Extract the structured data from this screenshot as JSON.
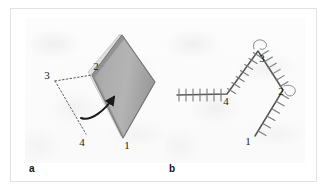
{
  "figure": {
    "width": 329,
    "height": 191,
    "background": "#ffffff",
    "frame_border_color": "#e2e2e2",
    "panel_background": "#fbfbfb"
  },
  "panels": [
    {
      "id": "a",
      "caption": "a",
      "description": "Shaded lozenge (diamond) plate with dotted construction lines and a curved arrow indicating folding direction",
      "vertex_labels": [
        {
          "label": "3",
          "x": 22,
          "y": 58
        },
        {
          "label": "2",
          "x": 72,
          "y": 57
        },
        {
          "label": "4",
          "x": 54,
          "y": 123
        },
        {
          "label": "1",
          "x": 104,
          "y": 127
        }
      ],
      "shape": {
        "name": "lozenge-plate",
        "fill_light": "#b9b9b9",
        "fill_dark": "#8e8e8e",
        "edge_color": "#6e6e6e",
        "rim_color": "#d9d9d9"
      },
      "arrow": {
        "name": "fold-arrow",
        "color": "#1a1a1a"
      },
      "dotted_line_color": "#4a4a4a"
    },
    {
      "id": "b",
      "caption": "b",
      "description": "Open polyline chain with hatch tick marks along each segment and numbered vertices",
      "vertex_labels": [
        {
          "label": "4",
          "x": 61,
          "y": 80
        },
        {
          "label": "3",
          "x": 96,
          "y": 37
        },
        {
          "label": "2",
          "x": 119,
          "y": 75
        },
        {
          "label": "1",
          "x": 88,
          "y": 123
        }
      ],
      "chain_color": "#565656",
      "hatch_color": "#7a7a7a",
      "curl_color": "#8a8a8a"
    }
  ],
  "colors": {
    "ink": "#191919",
    "caption": "#141414",
    "grey_mid": "#8e8e8e",
    "grey_light": "#b9b9b9",
    "frame": "#e2e2e2"
  }
}
